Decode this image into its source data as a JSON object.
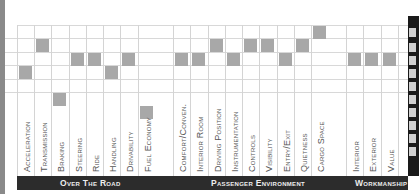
{
  "chart_data": {
    "type": "table",
    "title": "",
    "groups": [
      {
        "name": "Over The Road",
        "categories": [
          "Acceleration",
          "Transmission",
          "Braking",
          "Steering",
          "Ride",
          "Handling",
          "Drivability",
          "Fuel Economy"
        ]
      },
      {
        "name": "Passenger Environment",
        "categories": [
          "Comfort/Conven.",
          "Interior Room",
          "Driving Position",
          "Instrumentation",
          "Controls",
          "Visibility",
          "Entry/Exit",
          "Quietness",
          "Cargo Space"
        ]
      },
      {
        "name": "Workmanship",
        "categories": [
          "Interior",
          "Exterior",
          "Value"
        ]
      }
    ],
    "categories": [
      "Acceleration",
      "Transmission",
      "Braking",
      "Steering",
      "Ride",
      "Handling",
      "Drivability",
      "Fuel Economy",
      "Comfort/Conven.",
      "Interior Room",
      "Driving Position",
      "Instrumentation",
      "Controls",
      "Visibility",
      "Entry/Exit",
      "Quietness",
      "Cargo Space",
      "Interior",
      "Exterior",
      "Value"
    ],
    "values": [
      3,
      1,
      5,
      2,
      2,
      3,
      2,
      6,
      2,
      2,
      1,
      2,
      1,
      1,
      2,
      1,
      0,
      2,
      2,
      2
    ],
    "value_meaning": "row index from top of grid where the shaded square sits (0 = top)",
    "grid": true,
    "square_color": "#a8a8a8",
    "band_color": "#2c2c2c"
  },
  "columns": [
    {
      "label": "Acceleration",
      "x": 17,
      "row": 3
    },
    {
      "label": "Transmission",
      "x": 34,
      "row": 1
    },
    {
      "label": "Braking",
      "x": 51,
      "row": 5
    },
    {
      "label": "Steering",
      "x": 69,
      "row": 2
    },
    {
      "label": "Ride",
      "x": 86,
      "row": 2
    },
    {
      "label": "Handling",
      "x": 103,
      "row": 3
    },
    {
      "label": "Drivability",
      "x": 120,
      "row": 2
    },
    {
      "label": "Fuel Economy",
      "x": 138,
      "row": 6
    },
    {
      "label": "Comfort/Conven.",
      "x": 173,
      "row": 2
    },
    {
      "label": "Interior Room",
      "x": 190,
      "row": 2
    },
    {
      "label": "Driving Position",
      "x": 208,
      "row": 1
    },
    {
      "label": "Instrumentation",
      "x": 225,
      "row": 2
    },
    {
      "label": "Controls",
      "x": 242,
      "row": 1
    },
    {
      "label": "Visibility",
      "x": 259,
      "row": 1
    },
    {
      "label": "Entry/Exit",
      "x": 277,
      "row": 2
    },
    {
      "label": "Quietness",
      "x": 294,
      "row": 1
    },
    {
      "label": "Cargo Space",
      "x": 311,
      "row": 0
    },
    {
      "label": "Interior",
      "x": 346,
      "row": 2
    },
    {
      "label": "Exterior",
      "x": 363,
      "row": 2
    },
    {
      "label": "Value",
      "x": 381,
      "row": 2
    }
  ],
  "bands": [
    {
      "label": "Over The Road",
      "x": 17,
      "width": 139,
      "label_x": 60
    },
    {
      "label": "Passenger Environment",
      "x": 156,
      "width": 172,
      "label_x": 211
    },
    {
      "label": "Workmanship",
      "x": 328,
      "width": 80,
      "label_x": 355
    }
  ]
}
